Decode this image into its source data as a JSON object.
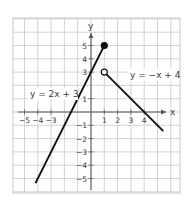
{
  "graph": {
    "axes": {
      "x_label": "x",
      "y_label": "y",
      "x_ticks": [
        {
          "value": -5,
          "label": "−5"
        },
        {
          "value": -4,
          "label": "−4"
        },
        {
          "value": -3,
          "label": "−3"
        },
        {
          "value": 1,
          "label": "1"
        },
        {
          "value": 2,
          "label": "2"
        },
        {
          "value": 3,
          "label": "3"
        },
        {
          "value": 4,
          "label": "4"
        }
      ],
      "y_ticks": [
        {
          "value": 5,
          "label": "5"
        },
        {
          "value": 4,
          "label": "4"
        },
        {
          "value": 3,
          "label": "3"
        },
        {
          "value": 1,
          "label": "1"
        },
        {
          "value": -1,
          "label": "−1"
        },
        {
          "value": -2,
          "label": "−2"
        },
        {
          "value": -3,
          "label": "−3"
        },
        {
          "value": -4,
          "label": "−4"
        },
        {
          "value": -5,
          "label": "−5"
        }
      ]
    },
    "pieces": [
      {
        "equation_label": "y = 2x + 3",
        "from": [
          -4.15,
          -5.3
        ],
        "to": [
          1,
          5
        ],
        "endpoint": {
          "at": [
            1,
            5
          ],
          "type": "closed"
        }
      },
      {
        "equation_label": "y = −x + 4",
        "from": [
          1,
          3
        ],
        "to": [
          5.4,
          -1.4
        ],
        "endpoint": {
          "at": [
            1,
            3
          ],
          "type": "open"
        }
      }
    ],
    "colors": {
      "grid": "#c8c8c8",
      "axis": "#555555",
      "line": "#111111"
    }
  },
  "chart_data": {
    "type": "line",
    "title": "",
    "xlabel": "x",
    "ylabel": "y",
    "xlim": [
      -5.8,
      6.7
    ],
    "ylim": [
      -6.1,
      7
    ],
    "grid": true,
    "series": [
      {
        "name": "y = 2x + 3",
        "x": [
          -4.15,
          1
        ],
        "y": [
          -5.3,
          5
        ],
        "end_marker": "closed circle at (1, 5)"
      },
      {
        "name": "y = −x + 4",
        "x": [
          1,
          5.4
        ],
        "y": [
          3,
          -1.4
        ],
        "start_marker": "open circle at (1, 3)"
      }
    ],
    "x_tick_labels": [
      "−5",
      "−4",
      "−3",
      "1",
      "2",
      "3",
      "4"
    ],
    "y_tick_labels": [
      "5",
      "4",
      "3",
      "1",
      "−1",
      "−2",
      "−3",
      "−4",
      "−5"
    ]
  }
}
